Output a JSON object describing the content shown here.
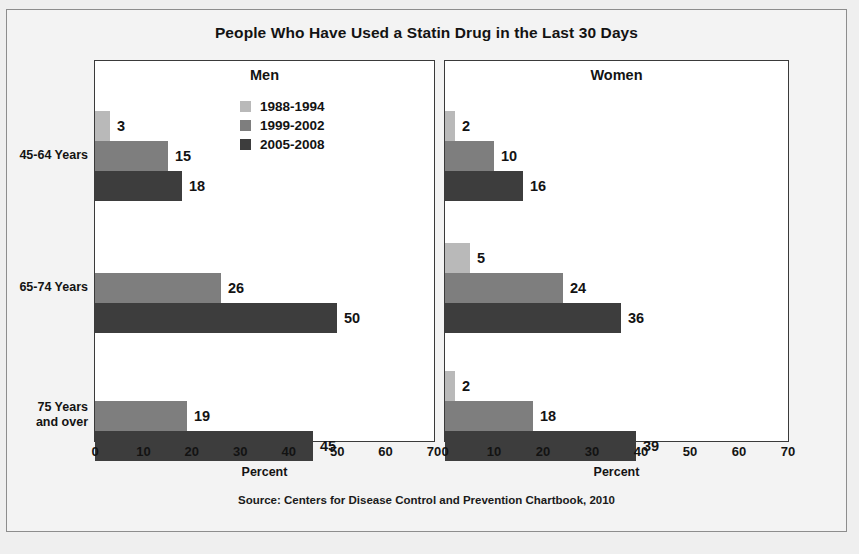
{
  "figure": {
    "title": "People Who Have Used a Statin Drug in the Last 30 Days",
    "source": "Source: Centers for Disease Control and Prevention Chartbook, 2010",
    "axis_label": "Percent",
    "panels": [
      {
        "key": "men",
        "title": "Men"
      },
      {
        "key": "women",
        "title": "Women"
      }
    ],
    "legend": [
      {
        "label": "1988-1994",
        "color": "#b9b9b9"
      },
      {
        "label": "1999-2002",
        "color": "#7e7e7e"
      },
      {
        "label": "2005-2008",
        "color": "#3d3d3d"
      }
    ],
    "categories": [
      "45-64 Years",
      "65-74 Years",
      "75 Years\nand over"
    ]
  },
  "chart_data": {
    "type": "bar",
    "title": "People Who Have Used a Statin Drug in the Last 30 Days",
    "subtitle": "",
    "orientation": "horizontal",
    "panels": [
      "Men",
      "Women"
    ],
    "categories": [
      "45-64 Years",
      "65-74 Years",
      "75 Years and over"
    ],
    "series": [
      {
        "name": "1988-1994",
        "color": "#b9b9b9",
        "values": {
          "Men": [
            3,
            null,
            null
          ],
          "Women": [
            2,
            5,
            2
          ]
        }
      },
      {
        "name": "1999-2002",
        "color": "#7e7e7e",
        "values": {
          "Men": [
            15,
            26,
            19
          ],
          "Women": [
            10,
            24,
            18
          ]
        }
      },
      {
        "name": "2005-2008",
        "color": "#3d3d3d",
        "values": {
          "Men": [
            18,
            50,
            45
          ],
          "Women": [
            16,
            36,
            39
          ]
        }
      }
    ],
    "xlabel": "Percent",
    "ylabel": "",
    "xlim": [
      0,
      70
    ],
    "xticks": [
      0,
      10,
      20,
      30,
      40,
      50,
      60,
      70
    ],
    "grid": false,
    "legend_position": "inside-top-left",
    "data_labels": true,
    "source": "Source: Centers for Disease Control and Prevention Chartbook, 2010"
  }
}
